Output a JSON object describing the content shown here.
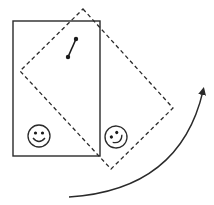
{
  "diagram": {
    "colors": {
      "stroke": "#2a2a2a",
      "background": "#ffffff"
    },
    "original_rectangle": {
      "style": "solid",
      "x": 13,
      "y": 21,
      "width": 87,
      "height": 135
    },
    "rotated_rectangle": {
      "style": "dashed",
      "points": [
        [
          83,
          9
        ],
        [
          173,
          108
        ],
        [
          111,
          169
        ],
        [
          20,
          71
        ]
      ]
    },
    "segment": {
      "endpoints": [
        [
          76,
          39
        ],
        [
          68,
          57
        ]
      ]
    },
    "smiley_original": {
      "cx": 39,
      "cy": 136,
      "r": 11,
      "rotation": 0
    },
    "smiley_rotated": {
      "cx": 116,
      "cy": 137,
      "r": 11,
      "rotation": -40
    },
    "rotation_arrow": {
      "direction": "counterclockwise-up",
      "start": [
        69,
        197
      ],
      "end": [
        203,
        90
      ],
      "icon": "curved-arrow-icon"
    }
  }
}
